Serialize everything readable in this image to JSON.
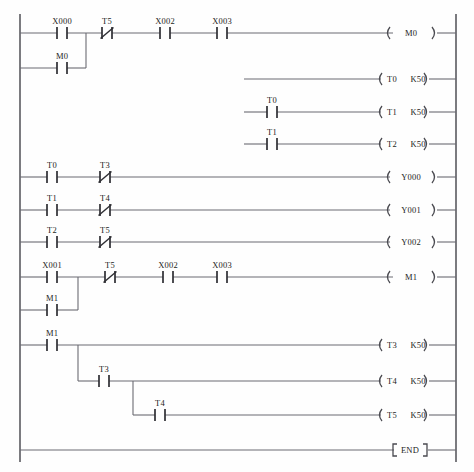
{
  "diagram": {
    "type": "ladder-logic",
    "canvas": {
      "width": 474,
      "height": 472
    },
    "rails": {
      "left_x": 20,
      "right_x": 456,
      "top_y": 14,
      "bottom_y": 462
    },
    "colors": {
      "background": "#fefefe",
      "rail": "#5a5a60",
      "wire": "#6b6b72",
      "contact": "#2e2e33",
      "text": "#1d1d22"
    },
    "symbols": {
      "contact_no": "-| |-",
      "contact_nc": "-|/|-",
      "coil": "-( )-",
      "end_block": "-[ END ]-"
    },
    "rungs": [
      {
        "id": "rung-1-m0",
        "y": 33,
        "contacts": [
          {
            "name": "X000",
            "x": 62,
            "type": "no"
          },
          {
            "name": "T5",
            "x": 107,
            "type": "nc"
          },
          {
            "name": "X002",
            "x": 165,
            "type": "no"
          },
          {
            "name": "X003",
            "x": 222,
            "type": "no"
          }
        ],
        "coil": {
          "name": "M0",
          "value": "",
          "x": 410
        },
        "wire_from": 20,
        "wire_to": 393
      },
      {
        "id": "rung-1-branch-m0-latch",
        "y": 68,
        "contacts": [
          {
            "name": "M0",
            "x": 62,
            "type": "no"
          }
        ],
        "coil": null,
        "wire_from": 20,
        "wire_to": 86,
        "branch_vertical": {
          "x": 86,
          "from_y": 33,
          "to_y": 68
        }
      },
      {
        "id": "rung-2-t0",
        "y": 79,
        "contacts": [],
        "coil": {
          "name": "T0",
          "value": "K50",
          "x": 402
        },
        "wire_from": 244,
        "wire_to": 381
      },
      {
        "id": "rung-3-t1",
        "y": 112,
        "contacts": [
          {
            "name": "T0",
            "x": 272,
            "type": "no"
          }
        ],
        "coil": {
          "name": "T1",
          "value": "K50",
          "x": 402
        },
        "wire_from": 244,
        "wire_to": 381
      },
      {
        "id": "rung-4-t2",
        "y": 144,
        "contacts": [
          {
            "name": "T1",
            "x": 272,
            "type": "no"
          }
        ],
        "coil": {
          "name": "T2",
          "value": "K50",
          "x": 402
        },
        "wire_from": 244,
        "wire_to": 381
      },
      {
        "id": "rung-5-y000",
        "y": 177,
        "contacts": [
          {
            "name": "T0",
            "x": 52,
            "type": "no"
          },
          {
            "name": "T3",
            "x": 105,
            "type": "nc"
          }
        ],
        "coil": {
          "name": "Y000",
          "value": "",
          "x": 410
        },
        "wire_from": 20,
        "wire_to": 390
      },
      {
        "id": "rung-6-y001",
        "y": 210,
        "contacts": [
          {
            "name": "T1",
            "x": 52,
            "type": "no"
          },
          {
            "name": "T4",
            "x": 105,
            "type": "nc"
          }
        ],
        "coil": {
          "name": "Y001",
          "value": "",
          "x": 410
        },
        "wire_from": 20,
        "wire_to": 390
      },
      {
        "id": "rung-7-y002",
        "y": 242,
        "contacts": [
          {
            "name": "T2",
            "x": 52,
            "type": "no"
          },
          {
            "name": "T5",
            "x": 105,
            "type": "nc"
          }
        ],
        "coil": {
          "name": "Y002",
          "value": "",
          "x": 410
        },
        "wire_from": 20,
        "wire_to": 390
      },
      {
        "id": "rung-8-m1",
        "y": 277,
        "contacts": [
          {
            "name": "X001",
            "x": 52,
            "type": "no"
          },
          {
            "name": "T5",
            "x": 110,
            "type": "nc"
          },
          {
            "name": "X002",
            "x": 168,
            "type": "no"
          },
          {
            "name": "X003",
            "x": 222,
            "type": "no"
          }
        ],
        "coil": {
          "name": "M1",
          "value": "",
          "x": 410
        },
        "wire_from": 20,
        "wire_to": 393
      },
      {
        "id": "rung-8-branch-m1-latch",
        "y": 310,
        "contacts": [
          {
            "name": "M1",
            "x": 52,
            "type": "no"
          }
        ],
        "coil": null,
        "wire_from": 20,
        "wire_to": 78,
        "branch_vertical": {
          "x": 78,
          "from_y": 277,
          "to_y": 310
        }
      },
      {
        "id": "rung-9-t3",
        "y": 345,
        "contacts": [
          {
            "name": "M1",
            "x": 52,
            "type": "no"
          }
        ],
        "coil": {
          "name": "T3",
          "value": "K50",
          "x": 402
        },
        "wire_from": 20,
        "wire_to": 381
      },
      {
        "id": "rung-10-t4",
        "y": 381,
        "contacts": [
          {
            "name": "T3",
            "x": 104,
            "type": "no"
          }
        ],
        "coil": {
          "name": "T4",
          "value": "K50",
          "x": 402
        },
        "wire_from": 78,
        "wire_to": 381,
        "branch_vertical": {
          "x": 78,
          "from_y": 345,
          "to_y": 381
        }
      },
      {
        "id": "rung-11-t5",
        "y": 415,
        "contacts": [
          {
            "name": "T4",
            "x": 160,
            "type": "no"
          }
        ],
        "coil": {
          "name": "T5",
          "value": "K50",
          "x": 402
        },
        "wire_from": 133,
        "wire_to": 381,
        "branch_vertical": {
          "x": 133,
          "from_y": 381,
          "to_y": 415
        }
      },
      {
        "id": "rung-12-end",
        "y": 450,
        "contacts": [],
        "coil": null,
        "end_block": {
          "label": "END",
          "x": 409
        },
        "wire_from": 20,
        "wire_to": 394
      }
    ]
  }
}
